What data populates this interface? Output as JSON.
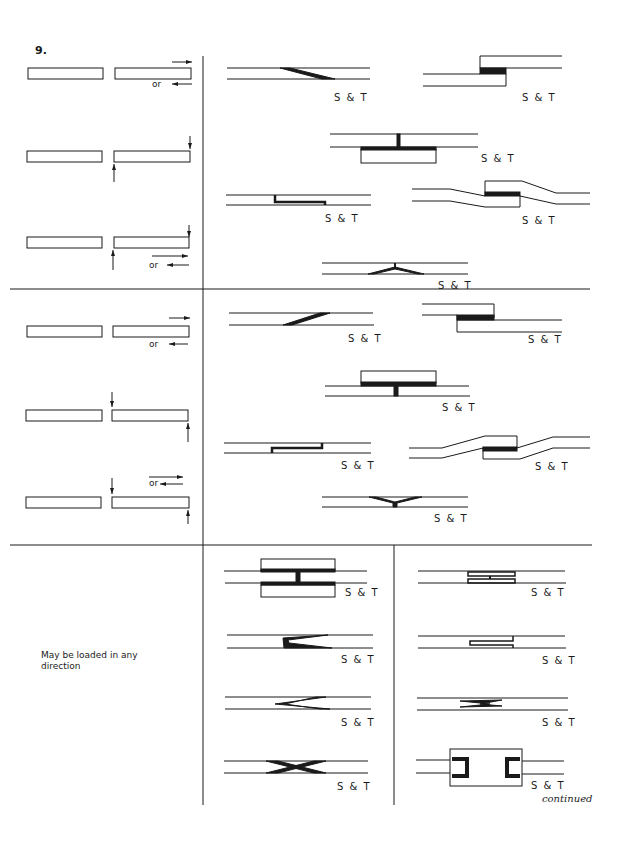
{
  "figure": {
    "number": "9.",
    "label_joint": "S & T",
    "or_label": "or",
    "note": "May be loaded in any direction",
    "continued": "continued"
  },
  "sections": [
    {
      "id": "section-1",
      "loading": [
        {
          "id": "load-1a",
          "description": "axial tension/compression",
          "or": true
        },
        {
          "id": "load-1b",
          "description": "transverse shear pair"
        },
        {
          "id": "load-1c",
          "description": "transverse shear or axial",
          "or": true
        }
      ],
      "joints": [
        {
          "id": "j1",
          "type": "scarf",
          "label": "S & T"
        },
        {
          "id": "j2",
          "type": "stepped lap",
          "label": "S & T"
        },
        {
          "id": "j3",
          "type": "T-strap",
          "label": "S & T"
        },
        {
          "id": "j4",
          "type": "joggle lap",
          "label": "S & T"
        },
        {
          "id": "j5",
          "type": "offset lap strap",
          "label": "S & T"
        },
        {
          "id": "j6",
          "type": "Y tee",
          "label": "S & T"
        }
      ]
    },
    {
      "id": "section-2",
      "loading": [
        {
          "id": "load-2a",
          "description": "axial tension/compression",
          "or": true
        },
        {
          "id": "load-2b",
          "description": "transverse shear pair"
        },
        {
          "id": "load-2c",
          "description": "axial or transverse",
          "or": true
        }
      ],
      "joints": [
        {
          "id": "j7",
          "type": "scarf",
          "label": "S & T"
        },
        {
          "id": "j8",
          "type": "stepped lap",
          "label": "S & T"
        },
        {
          "id": "j9",
          "type": "T-strap",
          "label": "S & T"
        },
        {
          "id": "j10",
          "type": "offset lap strap",
          "label": "S & T"
        },
        {
          "id": "j11",
          "type": "joggle lap",
          "label": "S & T"
        },
        {
          "id": "j12",
          "type": "Y tee",
          "label": "S & T"
        }
      ]
    },
    {
      "id": "section-3",
      "note": "May be loaded in any direction",
      "joints": [
        {
          "id": "j13",
          "type": "double strap H",
          "label": "S & T"
        },
        {
          "id": "j14",
          "type": "double tongue H",
          "label": "S & T"
        },
        {
          "id": "j15",
          "type": "V tongue",
          "label": "S & T"
        },
        {
          "id": "j16",
          "type": "tongue and groove",
          "label": "S & T"
        },
        {
          "id": "j17",
          "type": "V scarf",
          "label": "S & T"
        },
        {
          "id": "j18",
          "type": "multiple V",
          "label": "S & T"
        },
        {
          "id": "j19",
          "type": "X scarf",
          "label": "S & T"
        },
        {
          "id": "j20",
          "type": "channel clamp",
          "label": "S & T"
        }
      ]
    }
  ],
  "colors": {
    "ink": "#1a1a1a",
    "paper": "#ffffff"
  }
}
